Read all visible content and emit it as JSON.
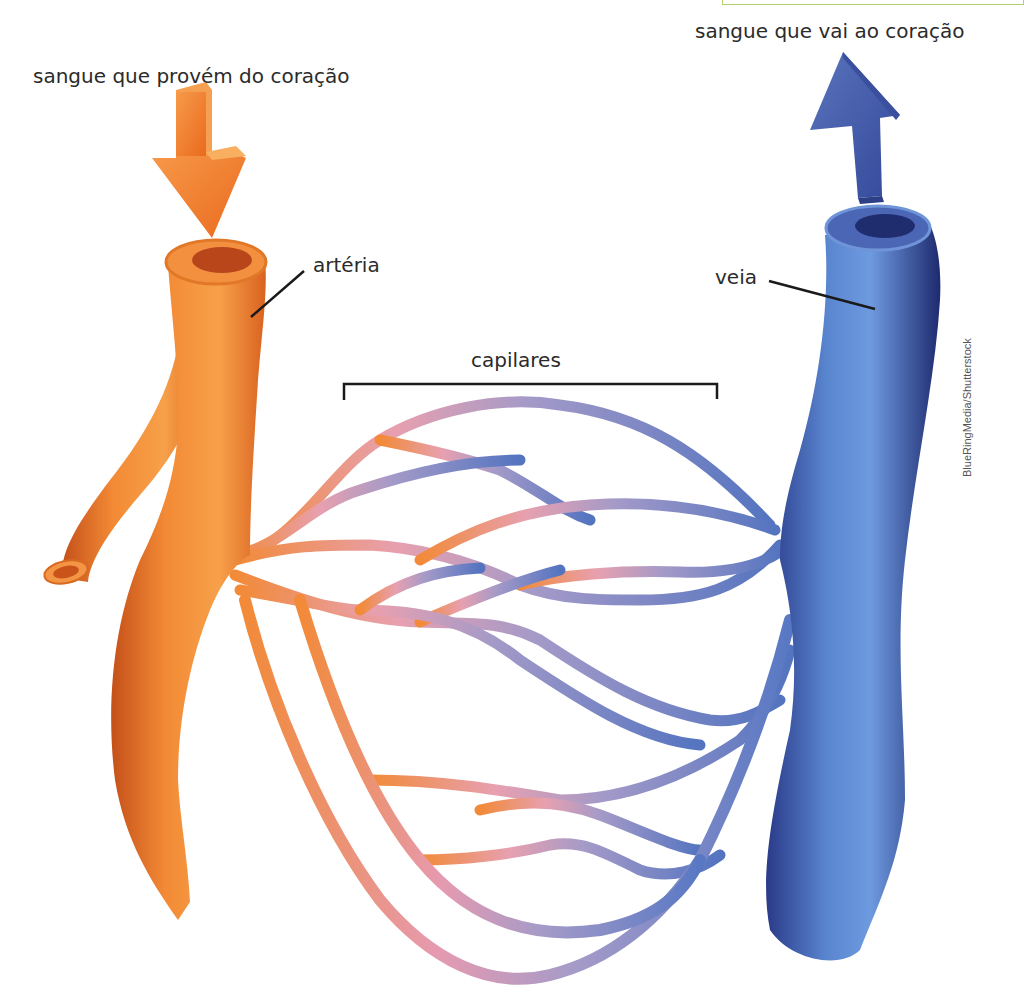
{
  "labels": {
    "blood_from_heart": "sangue que provém do coração",
    "blood_to_heart": "sangue que vai ao coração",
    "artery": "artéria",
    "vein": "veia",
    "capillaries": "capilares"
  },
  "credit": "BlueRingMedia/Shutterstock",
  "icons": {
    "arrow_down": "arrow-down-icon",
    "arrow_up": "arrow-up-icon"
  },
  "colors": {
    "artery": "#f07a22",
    "artery_dark": "#c8531a",
    "capillary_mid": "#d89ab8",
    "vein": "#4a64b0",
    "vein_dark": "#26347a",
    "frame": "#b5cf6e",
    "text": "#2b2b2b"
  }
}
